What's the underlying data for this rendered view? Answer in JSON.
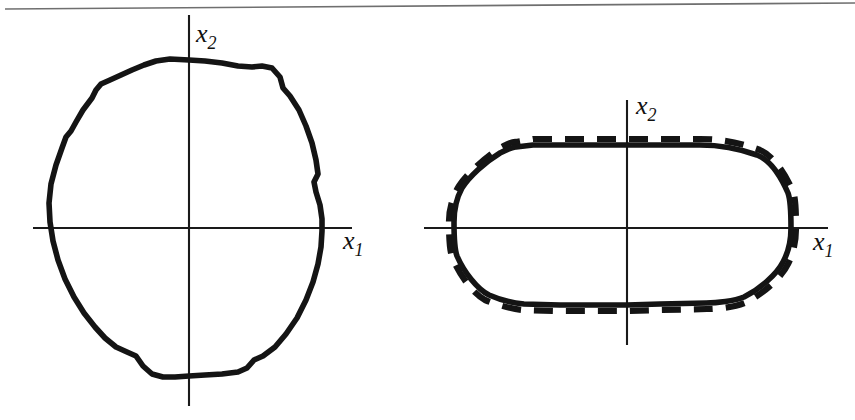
{
  "figure": {
    "background_color": "#ffffff",
    "ink_color": "#141414",
    "axis_color": "#1a1a1a",
    "scan_rule_color": "#6f6f6f",
    "width": 855,
    "height": 420
  },
  "panels": [
    {
      "id": "left-panel",
      "name": "irregular-region-panel",
      "origin": {
        "x": 189,
        "y": 228
      },
      "x_axis": {
        "label": "x",
        "subscript": "1",
        "label_x": 343,
        "label_y": 249,
        "x_start": 33,
        "x_end": 352
      },
      "y_axis": {
        "label": "x",
        "subscript": "2",
        "label_x": 196,
        "label_y": 42,
        "y_start": 15,
        "y_end": 406
      },
      "curves": [
        {
          "name": "irregular-closed-contour",
          "style": "solid",
          "description": "jagged near-circular closed contour"
        }
      ]
    },
    {
      "id": "right-panel",
      "name": "stadium-region-panel",
      "origin": {
        "x": 627,
        "y": 228
      },
      "x_axis": {
        "label": "x",
        "subscript": "1",
        "label_x": 813,
        "label_y": 250,
        "x_start": 424,
        "x_end": 828
      },
      "y_axis": {
        "label": "x",
        "subscript": "2",
        "label_x": 636,
        "label_y": 114,
        "y_start": 100,
        "y_end": 345
      },
      "curves": [
        {
          "name": "stadium-contour-solid",
          "style": "solid",
          "description": "smooth stadium / rounded-rectangle closed contour"
        },
        {
          "name": "stadium-contour-dashed",
          "style": "dashed",
          "dash_length": 19,
          "gap_length": 13,
          "description": "dashed approximation offset slightly outside the solid stadium contour"
        }
      ]
    }
  ],
  "chart_data": {
    "type": "line",
    "title": "",
    "xlabel": "x1",
    "ylabel": "x2",
    "grid": false,
    "legend": "none",
    "series": [
      {
        "name": "irregular-closed-contour",
        "panel": "left-panel",
        "style": "solid",
        "closed": true,
        "points_px": [
          [
            189,
            60
          ],
          [
            205,
            61
          ],
          [
            222,
            63
          ],
          [
            238,
            66
          ],
          [
            252,
            67
          ],
          [
            262,
            66
          ],
          [
            272,
            68
          ],
          [
            280,
            77
          ],
          [
            283,
            88
          ],
          [
            290,
            96
          ],
          [
            299,
            110
          ],
          [
            306,
            126
          ],
          [
            312,
            143
          ],
          [
            316,
            160
          ],
          [
            318,
            174
          ],
          [
            314,
            182
          ],
          [
            316,
            192
          ],
          [
            320,
            205
          ],
          [
            322,
            219
          ],
          [
            322,
            231
          ],
          [
            321,
            247
          ],
          [
            318,
            264
          ],
          [
            313,
            282
          ],
          [
            306,
            300
          ],
          [
            297,
            318
          ],
          [
            286,
            334
          ],
          [
            275,
            347
          ],
          [
            263,
            356
          ],
          [
            254,
            360
          ],
          [
            247,
            368
          ],
          [
            238,
            372
          ],
          [
            222,
            374
          ],
          [
            205,
            375
          ],
          [
            189,
            376
          ],
          [
            175,
            377
          ],
          [
            163,
            377
          ],
          [
            152,
            374
          ],
          [
            143,
            366
          ],
          [
            136,
            356
          ],
          [
            127,
            352
          ],
          [
            116,
            347
          ],
          [
            105,
            338
          ],
          [
            95,
            327
          ],
          [
            84,
            313
          ],
          [
            74,
            297
          ],
          [
            65,
            279
          ],
          [
            58,
            260
          ],
          [
            53,
            241
          ],
          [
            50,
            222
          ],
          [
            49,
            203
          ],
          [
            51,
            184
          ],
          [
            56,
            165
          ],
          [
            62,
            148
          ],
          [
            66,
            137
          ],
          [
            71,
            131
          ],
          [
            76,
            122
          ],
          [
            83,
            110
          ],
          [
            92,
            98
          ],
          [
            96,
            90
          ],
          [
            101,
            84
          ],
          [
            110,
            80
          ],
          [
            121,
            75
          ],
          [
            132,
            70
          ],
          [
            144,
            65
          ],
          [
            156,
            61
          ],
          [
            170,
            59
          ]
        ]
      },
      {
        "name": "stadium-contour-solid",
        "panel": "right-panel",
        "style": "solid",
        "closed": true,
        "points_px": [
          [
            533,
            145
          ],
          [
            600,
            145
          ],
          [
            627,
            145
          ],
          [
            700,
            145
          ],
          [
            722,
            146
          ],
          [
            740,
            149
          ],
          [
            757,
            155
          ],
          [
            770,
            164
          ],
          [
            781,
            177
          ],
          [
            788,
            193
          ],
          [
            791,
            210
          ],
          [
            791,
            228
          ],
          [
            789,
            245
          ],
          [
            783,
            262
          ],
          [
            773,
            277
          ],
          [
            760,
            289
          ],
          [
            744,
            297
          ],
          [
            726,
            301
          ],
          [
            706,
            303
          ],
          [
            660,
            304
          ],
          [
            627,
            305
          ],
          [
            560,
            305
          ],
          [
            524,
            304
          ],
          [
            506,
            301
          ],
          [
            489,
            295
          ],
          [
            475,
            285
          ],
          [
            464,
            272
          ],
          [
            457,
            256
          ],
          [
            454,
            239
          ],
          [
            454,
            222
          ],
          [
            456,
            205
          ],
          [
            462,
            188
          ],
          [
            472,
            174
          ],
          [
            485,
            162
          ],
          [
            500,
            153
          ],
          [
            516,
            147
          ]
        ]
      },
      {
        "name": "stadium-contour-dashed",
        "panel": "right-panel",
        "style": "dashed",
        "closed": true,
        "points_px": [
          [
            533,
            139
          ],
          [
            600,
            139
          ],
          [
            627,
            139
          ],
          [
            700,
            139
          ],
          [
            722,
            140
          ],
          [
            741,
            143
          ],
          [
            760,
            150
          ],
          [
            774,
            160
          ],
          [
            785,
            174
          ],
          [
            793,
            191
          ],
          [
            796,
            210
          ],
          [
            796,
            228
          ],
          [
            794,
            246
          ],
          [
            788,
            264
          ],
          [
            778,
            280
          ],
          [
            764,
            293
          ],
          [
            747,
            302
          ],
          [
            728,
            307
          ],
          [
            707,
            309
          ],
          [
            660,
            310
          ],
          [
            627,
            311
          ],
          [
            560,
            311
          ],
          [
            523,
            310
          ],
          [
            503,
            307
          ],
          [
            485,
            300
          ],
          [
            470,
            289
          ],
          [
            459,
            274
          ],
          [
            452,
            257
          ],
          [
            449,
            239
          ],
          [
            449,
            221
          ],
          [
            452,
            203
          ],
          [
            459,
            186
          ],
          [
            470,
            171
          ],
          [
            484,
            158
          ],
          [
            500,
            148
          ],
          [
            516,
            142
          ]
        ]
      }
    ]
  }
}
